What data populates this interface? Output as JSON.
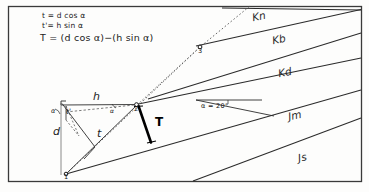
{
  "figure": {
    "frame": {
      "border_color": "#3a3a3a"
    }
  },
  "formulas": {
    "line1": "t = d cos α",
    "line2": "t'= h sin α",
    "line3": "T = (d cos α)−(h sin α)"
  },
  "measures": {
    "h": "h",
    "t": "t",
    "t_prime": "t'",
    "d": "d",
    "T": "T",
    "alpha_left": "α",
    "alpha_mid": "α"
  },
  "points": {
    "p1": "1",
    "p2": "2",
    "p3": "3"
  },
  "dip": {
    "label": "α  =  20°",
    "value": 20,
    "unit": "degrees"
  },
  "units": [
    {
      "code": "Kn",
      "name": "unit-kn"
    },
    {
      "code": "Kb",
      "name": "unit-kb"
    },
    {
      "code": "Kd",
      "name": "unit-kd"
    },
    {
      "code": "Jm",
      "name": "unit-jm"
    },
    {
      "code": "Js",
      "name": "unit-js"
    }
  ],
  "colors": {
    "ink": "#2b2b2b",
    "heavy": "#000000",
    "dotted": "#555555",
    "paper": "#fdfdfc"
  }
}
